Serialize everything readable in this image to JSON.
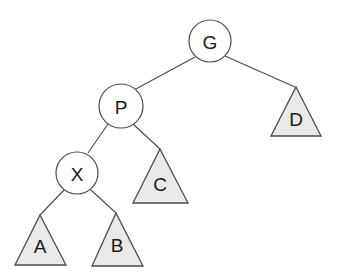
{
  "diagram": {
    "type": "binary-tree",
    "title": "",
    "colors": {
      "background": "#ffffff",
      "stroke": "#4a4a4a",
      "circle_fill": "#ffffff",
      "triangle_fill": "#e9e9e9",
      "label_text": "#1a1a1a"
    },
    "circle_nodes": [
      {
        "id": "G",
        "label": "G",
        "cx": 210,
        "cy": 41,
        "r": 21
      },
      {
        "id": "P",
        "label": "P",
        "cx": 121,
        "cy": 106,
        "r": 22
      },
      {
        "id": "X",
        "label": "X",
        "cx": 77,
        "cy": 173,
        "r": 21
      }
    ],
    "triangle_nodes": [
      {
        "id": "D",
        "label": "D",
        "apex_x": 296,
        "apex_y": 87,
        "left_x": 271,
        "right_x": 321,
        "base_y": 136,
        "label_x": 296,
        "label_y": 118
      },
      {
        "id": "C",
        "label": "C",
        "apex_x": 160,
        "apex_y": 149,
        "left_x": 133,
        "right_x": 188,
        "base_y": 203,
        "label_x": 160,
        "label_y": 183
      },
      {
        "id": "A",
        "label": "A",
        "apex_x": 40,
        "apex_y": 215,
        "left_x": 15,
        "right_x": 66,
        "base_y": 265,
        "label_x": 40,
        "label_y": 245
      },
      {
        "id": "B",
        "label": "B",
        "apex_x": 116,
        "apex_y": 213,
        "left_x": 92,
        "right_x": 143,
        "base_y": 266,
        "label_x": 117,
        "label_y": 244
      }
    ],
    "edges": [
      {
        "id": "G-P",
        "from": "G",
        "to": "P",
        "x1": 195,
        "y1": 57,
        "x2": 134,
        "y2": 90
      },
      {
        "id": "G-D",
        "from": "G",
        "to": "D",
        "x1": 225,
        "y1": 56,
        "x2": 295,
        "y2": 87
      },
      {
        "id": "P-X",
        "from": "P",
        "to": "X",
        "x1": 108,
        "y1": 124,
        "x2": 88,
        "y2": 153
      },
      {
        "id": "P-C",
        "from": "P",
        "to": "C",
        "x1": 133,
        "y1": 124,
        "x2": 160,
        "y2": 149
      },
      {
        "id": "X-A",
        "from": "X",
        "to": "A",
        "x1": 64,
        "y1": 190,
        "x2": 40,
        "y2": 215
      },
      {
        "id": "X-B",
        "from": "X",
        "to": "B",
        "x1": 91,
        "y1": 190,
        "x2": 116,
        "y2": 213
      }
    ]
  }
}
